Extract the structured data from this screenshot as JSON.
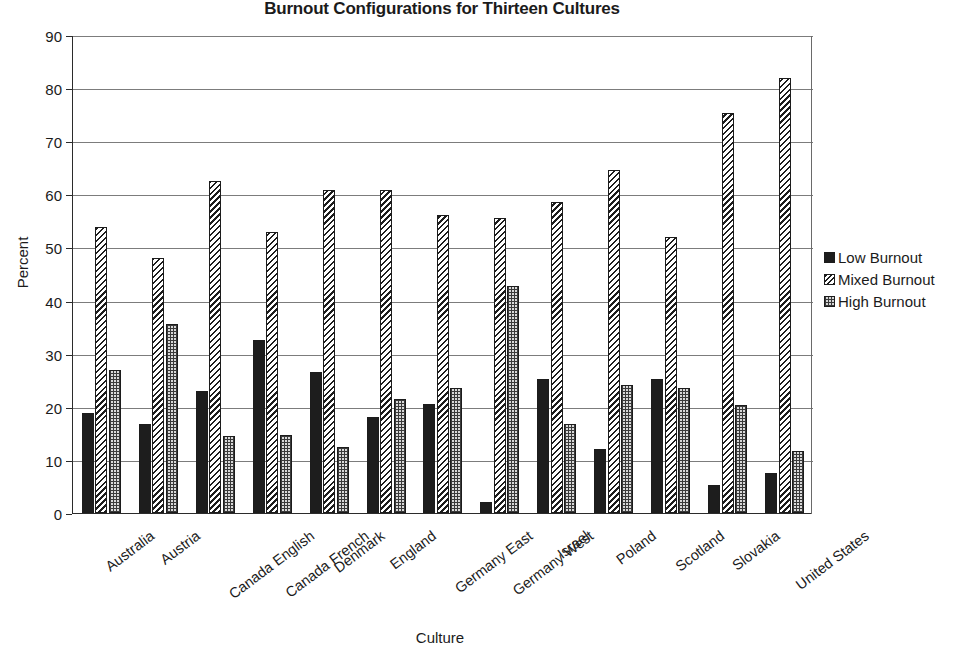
{
  "chart_data": {
    "type": "bar",
    "title": "Burnout Configurations for Thirteen Cultures",
    "xlabel": "Culture",
    "ylabel": "Percent",
    "ylim": [
      0,
      90
    ],
    "ytick_step": 10,
    "yticks": [
      0,
      10,
      20,
      30,
      40,
      50,
      60,
      70,
      80,
      90
    ],
    "grid": true,
    "legend_position": "right",
    "categories": [
      "Australia",
      "Austria",
      "Canada English",
      "Canada French",
      "Denmark",
      "England",
      "Germany East",
      "Germany West",
      "Israel",
      "Poland",
      "Scotland",
      "Slovakia",
      "United States"
    ],
    "series": [
      {
        "name": "Low Burnout",
        "pattern": "solid-black",
        "values": [
          18.8,
          16.7,
          22.9,
          32.5,
          26.6,
          18.0,
          20.5,
          2.1,
          25.3,
          12.1,
          25.3,
          5.3,
          7.5
        ]
      },
      {
        "name": "Mixed Burnout",
        "pattern": "diagonal-hatch",
        "values": [
          53.9,
          48.0,
          62.5,
          53.0,
          60.8,
          60.8,
          56.2,
          55.5,
          58.5,
          64.5,
          52.0,
          75.4,
          81.9
        ]
      },
      {
        "name": "High Burnout",
        "pattern": "dotted-grid",
        "values": [
          27.0,
          35.5,
          14.5,
          14.7,
          12.5,
          21.4,
          23.6,
          42.8,
          16.8,
          24.1,
          23.5,
          20.3,
          11.7
        ]
      }
    ]
  },
  "legend": {
    "items": [
      {
        "label": "Low Burnout"
      },
      {
        "label": "Mixed Burnout"
      },
      {
        "label": "High Burnout"
      }
    ]
  },
  "colors": {
    "axis": "#2b2b2b",
    "grid": "#7c7c7c",
    "low": "#1d1d1d",
    "mixed": "#ffffff",
    "high": "#d9d9d9",
    "background": "#ffffff"
  }
}
